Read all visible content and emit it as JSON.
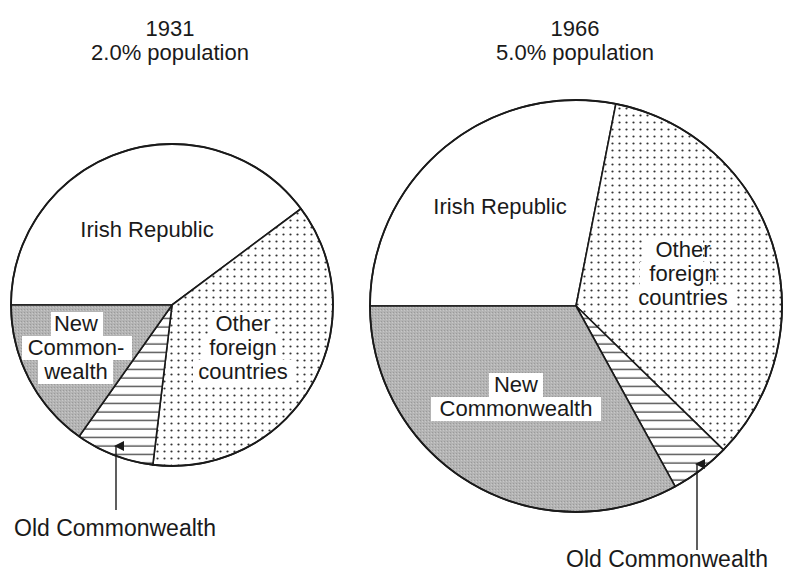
{
  "chart_data": [
    {
      "type": "pie",
      "title": "1931",
      "subtitle": "2.0% population",
      "start_angle_deg": 270,
      "direction": "clockwise",
      "slices": [
        {
          "label": "Irish Republic",
          "value": 39.8,
          "pattern": "plain"
        },
        {
          "label": "Other foreign countries",
          "value": 37.1,
          "pattern": "dots"
        },
        {
          "label": "Old Commonwealth",
          "value": 7.9,
          "pattern": "hlines"
        },
        {
          "label": "New Commonwealth",
          "value": 15.2,
          "pattern": "grey"
        }
      ],
      "annotations": [
        {
          "text": "Old Commonwealth",
          "arrow_to": "Old Commonwealth"
        }
      ],
      "legend": "none"
    },
    {
      "type": "pie",
      "title": "1966",
      "subtitle": "5.0% population",
      "start_angle_deg": 270,
      "direction": "clockwise",
      "slices": [
        {
          "label": "Irish Republic",
          "value": 28.1,
          "pattern": "plain"
        },
        {
          "label": "Other foreign countries",
          "value": 34.2,
          "pattern": "dots"
        },
        {
          "label": "Old Commonwealth",
          "value": 4.7,
          "pattern": "hlines"
        },
        {
          "label": "New Commonwealth",
          "value": 33.0,
          "pattern": "grey"
        }
      ],
      "annotations": [
        {
          "text": "Old Commonwealth",
          "arrow_to": "Old Commonwealth"
        }
      ],
      "legend": "none"
    }
  ],
  "pies": [
    {
      "year": "1931",
      "subtitle": "2.0% population",
      "cx": 172,
      "cy": 305,
      "r": 161,
      "title_x": 170,
      "title_y": 30,
      "subtitle_y": 56,
      "labels": {
        "irish": "Irish Republic",
        "other": [
          "Other",
          "foreign",
          "countries"
        ],
        "new": [
          "New",
          "Common-",
          "wealth"
        ],
        "old_callout": "Old Commonwealth"
      }
    },
    {
      "year": "1966",
      "subtitle": "5.0% population",
      "cx": 576,
      "cy": 306,
      "r": 206,
      "title_x": 575,
      "title_y": 30,
      "subtitle_y": 56,
      "labels": {
        "irish": "Irish Republic",
        "other": [
          "Other",
          "foreign",
          "countries"
        ],
        "new": [
          "New",
          "Commonwealth"
        ],
        "old_callout": "Old Commonwealth"
      }
    }
  ],
  "colors": {
    "outline": "#1a1a1a",
    "grey_fill": "#b8b8b8",
    "dot": "#333333",
    "hatch": "#333333",
    "background": "#ffffff",
    "label_bg": "#ffffff"
  }
}
